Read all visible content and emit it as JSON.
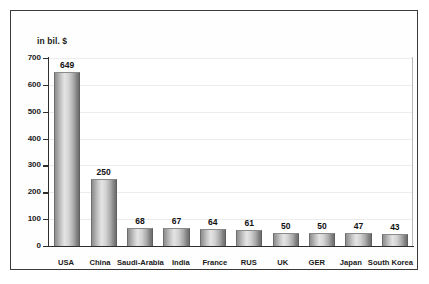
{
  "chart_data": {
    "type": "bar",
    "title": "",
    "subtitle": "",
    "xlabel": "",
    "ylabel": "in bil. $",
    "ylim": [
      0,
      700
    ],
    "yticks": [
      0,
      100,
      200,
      300,
      400,
      500,
      600,
      700
    ],
    "ytick_labels": [
      "0",
      "100",
      "200",
      "300",
      "400",
      "500",
      "600",
      "700"
    ],
    "grid": true,
    "legend": "none",
    "categories": [
      "USA",
      "China",
      "Saudi-Arabia",
      "India",
      "France",
      "RUS",
      "UK",
      "GER",
      "Japan",
      "South Korea"
    ],
    "values": [
      649,
      250,
      68,
      67,
      64,
      61,
      50,
      50,
      47,
      43
    ],
    "value_labels": [
      "649",
      "250",
      "68",
      "67",
      "64",
      "61",
      "50",
      "50",
      "47",
      "43"
    ],
    "bar_color": "#c9c9c9",
    "grid_color": "#ececec",
    "axis_color": "#2e2e2e",
    "text_color": "#1a1a1a"
  },
  "frame": {
    "border_color": "#3a3a3a",
    "background": "#fefefe"
  }
}
